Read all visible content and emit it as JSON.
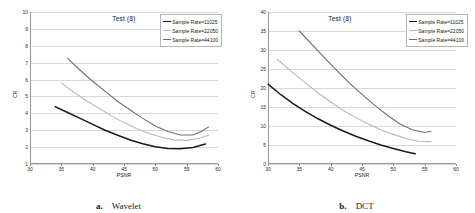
{
  "figure": {
    "panels": [
      {
        "id": "wavelet",
        "caption_letter": "a.",
        "caption_text": "Wavelet",
        "title": "Test (8)",
        "xlabel": "PSNR",
        "ylabel": "CR",
        "xticks": [
          "30",
          "35",
          "40",
          "45",
          "50",
          "55",
          "60"
        ],
        "yticks": [
          "10",
          "9",
          "8",
          "7",
          "6",
          "5",
          "4",
          "3",
          "2",
          "1"
        ],
        "legend": [
          {
            "label": "Sample Rate=11025",
            "color": "#1a1a1a"
          },
          {
            "label": "Sample Rate=22050",
            "color": "#b9b9b9"
          },
          {
            "label": "Sample Rate=44100",
            "color": "#6e6e6e"
          }
        ]
      },
      {
        "id": "dct",
        "caption_letter": "b.",
        "caption_text": "DCT",
        "title": "Test (8)",
        "xlabel": "PSNR",
        "ylabel": "CR",
        "xticks": [
          "30",
          "35",
          "40",
          "45",
          "50",
          "55",
          "60"
        ],
        "yticks": [
          "40",
          "35",
          "30",
          "25",
          "20",
          "15",
          "10",
          "5",
          "0"
        ],
        "legend": [
          {
            "label": "Sample Rate=11025",
            "color": "#1a1a1a"
          },
          {
            "label": "Sample Rate=22050",
            "color": "#b9b9b9"
          },
          {
            "label": "Sample Rate=44100",
            "color": "#6e6e6e"
          }
        ]
      }
    ]
  },
  "chart_data": [
    {
      "type": "line",
      "id": "wavelet",
      "title": "Test (8)",
      "xlabel": "PSNR",
      "ylabel": "CR",
      "xlim": [
        30,
        60
      ],
      "ylim": [
        1,
        10
      ],
      "grid": true,
      "legend_position": "top-right",
      "series": [
        {
          "name": "Sample Rate=11025",
          "color": "#1a1a1a",
          "x": [
            34.0,
            36.0,
            38.0,
            40.0,
            42.0,
            44.0,
            46.0,
            48.0,
            50.0,
            52.0,
            54.0,
            56.0,
            58.0
          ],
          "y": [
            4.4,
            4.05,
            3.7,
            3.35,
            3.0,
            2.7,
            2.42,
            2.2,
            2.02,
            1.92,
            1.9,
            1.98,
            2.18
          ]
        },
        {
          "name": "Sample Rate=22050",
          "color": "#b9b9b9",
          "x": [
            35.0,
            37.0,
            39.0,
            41.0,
            43.0,
            45.0,
            47.0,
            49.0,
            51.0,
            53.0,
            55.0,
            57.0,
            58.5
          ],
          "y": [
            5.8,
            5.25,
            4.75,
            4.3,
            3.85,
            3.45,
            3.1,
            2.8,
            2.58,
            2.43,
            2.4,
            2.52,
            2.7
          ]
        },
        {
          "name": "Sample Rate=44100",
          "color": "#6e6e6e",
          "x": [
            36.0,
            38.0,
            40.0,
            42.0,
            44.0,
            46.0,
            48.0,
            50.0,
            52.0,
            54.0,
            56.0,
            57.5,
            58.5
          ],
          "y": [
            7.25,
            6.55,
            5.9,
            5.3,
            4.7,
            4.2,
            3.7,
            3.25,
            2.92,
            2.72,
            2.72,
            2.95,
            3.2
          ]
        }
      ]
    },
    {
      "type": "line",
      "id": "dct",
      "title": "Test (8)",
      "xlabel": "PSNR",
      "ylabel": "CR",
      "xlim": [
        30,
        60
      ],
      "ylim": [
        0,
        40
      ],
      "grid": true,
      "legend_position": "top-right",
      "series": [
        {
          "name": "Sample Rate=11025",
          "color": "#1a1a1a",
          "x": [
            30.0,
            32.0,
            34.0,
            36.0,
            38.0,
            40.0,
            42.0,
            44.0,
            46.0,
            48.0,
            50.0,
            52.0,
            53.5
          ],
          "y": [
            21.0,
            18.3,
            15.9,
            13.8,
            11.9,
            10.2,
            8.7,
            7.3,
            6.1,
            5.0,
            4.1,
            3.2,
            2.7
          ]
        },
        {
          "name": "Sample Rate=22050",
          "color": "#b9b9b9",
          "x": [
            31.5,
            34.0,
            36.0,
            38.0,
            40.0,
            42.0,
            44.0,
            46.0,
            48.0,
            50.0,
            52.0,
            54.0,
            56.0
          ],
          "y": [
            27.5,
            24.0,
            21.3,
            18.7,
            16.3,
            14.1,
            12.2,
            10.5,
            9.0,
            7.8,
            6.7,
            6.0,
            5.9
          ]
        },
        {
          "name": "Sample Rate=44100",
          "color": "#6e6e6e",
          "x": [
            35.0,
            37.0,
            39.0,
            41.0,
            43.0,
            45.0,
            47.0,
            49.0,
            51.0,
            53.0,
            55.0,
            56.0
          ],
          "y": [
            35.0,
            31.5,
            28.0,
            24.6,
            21.3,
            18.3,
            15.5,
            12.9,
            10.6,
            9.0,
            8.3,
            8.6
          ]
        }
      ]
    }
  ]
}
